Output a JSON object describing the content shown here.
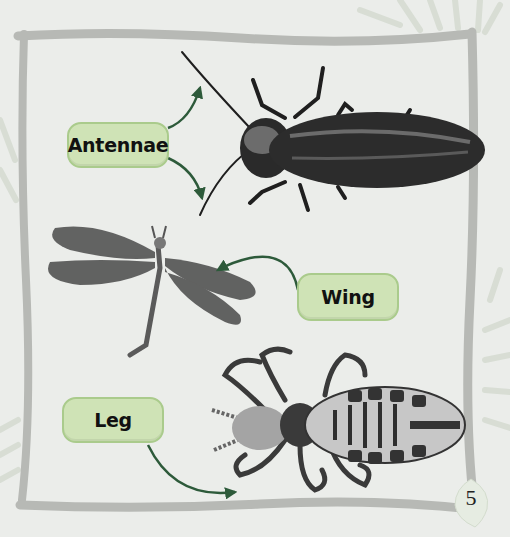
{
  "page": {
    "labels": {
      "antennae": "Antennae",
      "wing": "Wing",
      "leg": "Leg"
    },
    "page_number": "5",
    "insects": [
      {
        "name": "beetle",
        "points_to": "antennae"
      },
      {
        "name": "dragonfly",
        "points_to": "wing"
      },
      {
        "name": "louse",
        "points_to": "leg"
      }
    ],
    "colors": {
      "background": "#ebedea",
      "frame": "#b7b9b5",
      "label_fill": "#cfe3b6",
      "label_border": "#aacb8c",
      "arrow": "#2d5a3a",
      "leaf": "#d3dccd"
    }
  }
}
